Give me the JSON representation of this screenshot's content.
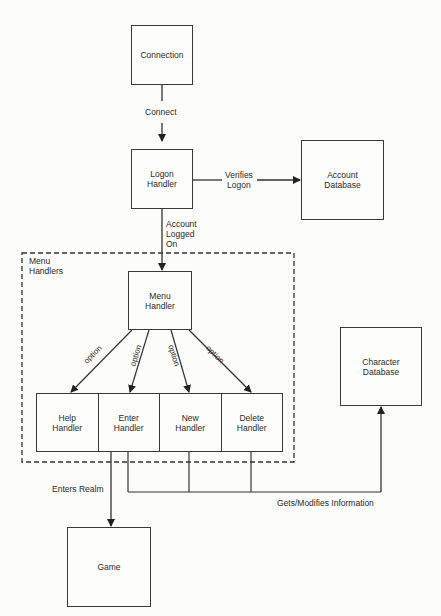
{
  "diagram": {
    "nodes": {
      "connection": "Connection",
      "logon_handler": "Logon\nHandler",
      "account_database": "Account\nDatabase",
      "menu_handler": "Menu\nHandler",
      "character_database": "Character\nDatabase",
      "game": "Game"
    },
    "group": {
      "label": "Menu\nHandlers"
    },
    "handlers": [
      {
        "label": "Help\nHandler"
      },
      {
        "label": "Enter\nHandler"
      },
      {
        "label": "New\nHandler"
      },
      {
        "label": "Delete\nHandler"
      }
    ],
    "edges": {
      "connect": "Connect",
      "verifies_logon": "Verifies\nLogon",
      "account_logged_on": "Account\nLogged\nOn",
      "option_1": "option",
      "option_2": "option",
      "option_3": "option",
      "option_4": "option",
      "enters_realm": "Enters Realm",
      "gets_modifies": "Gets/Modifies Information"
    }
  }
}
